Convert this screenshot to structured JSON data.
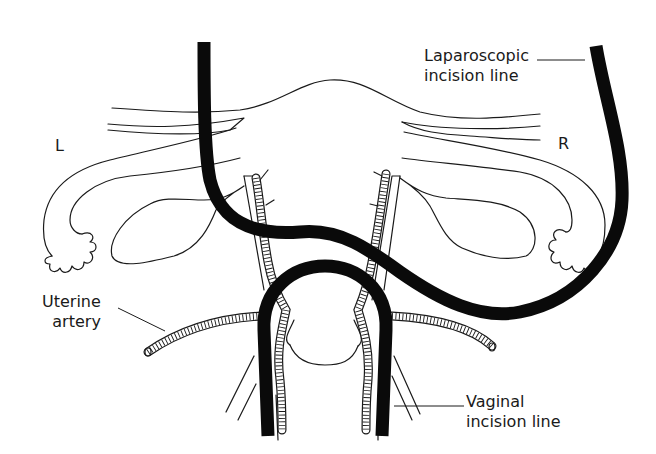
{
  "diagram": {
    "labels": {
      "left_side": "L",
      "right_side": "R",
      "laparoscopic_line": [
        "Laparoscopic",
        "incision line"
      ],
      "uterine_artery": [
        "Uterine",
        "artery"
      ],
      "vaginal_line": [
        "Vaginal",
        "incision line"
      ]
    },
    "colors": {
      "ink": "#1a1a1a",
      "incision_line": "#0a0a0a",
      "background": "#ffffff"
    },
    "structures": [
      "uterine-fundus",
      "left-fallopian-tube",
      "right-fallopian-tube",
      "left-ovary",
      "right-ovary",
      "round-ligaments",
      "cervix",
      "uterine-arteries",
      "vaginal-walls",
      "laparoscopic-incision-line",
      "vaginal-incision-line"
    ]
  }
}
